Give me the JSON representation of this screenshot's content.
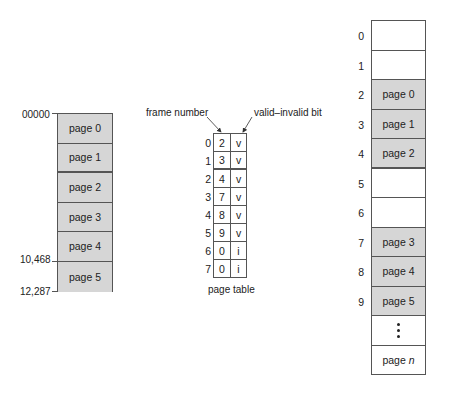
{
  "logical_memory": {
    "start_address": "00000",
    "page5_start_address": "10,468",
    "end_address": "12,287",
    "pages": [
      "page 0",
      "page 1",
      "page 2",
      "page 3",
      "page 4",
      "page 5"
    ]
  },
  "page_table": {
    "caption": "page table",
    "frame_number_label": "frame number",
    "valid_bit_label": "valid–invalid bit",
    "rows": [
      {
        "index": "0",
        "frame": "2",
        "bit": "v"
      },
      {
        "index": "1",
        "frame": "3",
        "bit": "v"
      },
      {
        "index": "2",
        "frame": "4",
        "bit": "v"
      },
      {
        "index": "3",
        "frame": "7",
        "bit": "v"
      },
      {
        "index": "4",
        "frame": "8",
        "bit": "v"
      },
      {
        "index": "5",
        "frame": "9",
        "bit": "v"
      },
      {
        "index": "6",
        "frame": "0",
        "bit": "i"
      },
      {
        "index": "7",
        "frame": "0",
        "bit": "i"
      }
    ]
  },
  "physical_memory": {
    "frames": [
      {
        "index": "0",
        "content": ""
      },
      {
        "index": "1",
        "content": ""
      },
      {
        "index": "2",
        "content": "page 0"
      },
      {
        "index": "3",
        "content": "page 1"
      },
      {
        "index": "4",
        "content": "page 2"
      },
      {
        "index": "5",
        "content": ""
      },
      {
        "index": "6",
        "content": ""
      },
      {
        "index": "7",
        "content": "page 3"
      },
      {
        "index": "8",
        "content": "page 4"
      },
      {
        "index": "9",
        "content": "page 5"
      },
      {
        "index": "",
        "content": "⋮"
      },
      {
        "index": "",
        "content_prefix": "page ",
        "content_italic": "n"
      }
    ]
  },
  "colors": {
    "filled_cell": "#d6d6d6",
    "border": "#555555",
    "text": "#222222"
  }
}
